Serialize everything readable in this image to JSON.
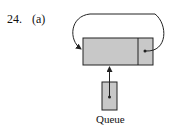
{
  "problem": {
    "number": "24.",
    "part": "(a)"
  },
  "diagram": {
    "node": {
      "data_field": "",
      "link_field": "pointer to self"
    },
    "queue_label": "Queue",
    "colors": {
      "fill": "#c8c8c8",
      "stroke": "#222222"
    }
  }
}
